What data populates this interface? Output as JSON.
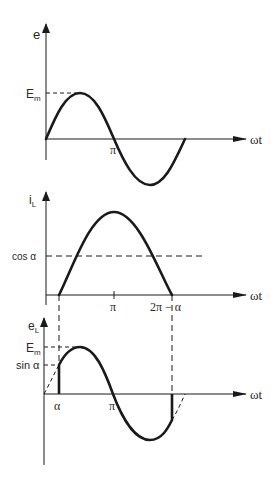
{
  "diagram": {
    "colors": {
      "ink": "#1a1a1a",
      "background": "#ffffff"
    },
    "panels": [
      {
        "id": "supply-voltage",
        "y_label": "e",
        "x_label": "ωt",
        "level_labels": [
          "Em"
        ],
        "tick_labels": [
          "π"
        ]
      },
      {
        "id": "load-current",
        "y_label": "iL",
        "x_label": "ωt",
        "level_labels": [
          "cos α"
        ],
        "tick_labels": [
          "π",
          "2π − α"
        ]
      },
      {
        "id": "load-voltage",
        "y_label": "eL",
        "x_label": "ωt",
        "level_labels": [
          "Em",
          "sin α"
        ],
        "tick_labels": [
          "α",
          "π"
        ]
      }
    ]
  },
  "labels": {
    "p1": {
      "y": "e",
      "x": "ωt",
      "em_main": "E",
      "em_sub": "m",
      "pi": "π"
    },
    "p2": {
      "y_main": "i",
      "y_sub": "L",
      "x": "ωt",
      "cos": "cos α",
      "pi": "π",
      "two_pi_alpha": "2π − α"
    },
    "p3": {
      "y_main": "e",
      "y_sub": "L",
      "x": "ωt",
      "em_main": "E",
      "em_sub": "m",
      "sin": "sin α",
      "alpha": "α",
      "pi": "π"
    }
  }
}
